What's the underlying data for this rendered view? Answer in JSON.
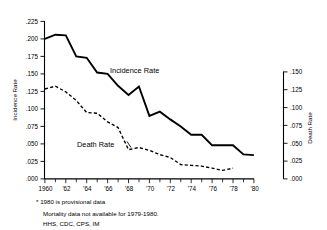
{
  "chart_data": {
    "type": "line",
    "title": "",
    "xlabel": "",
    "ylabel": "Incidence Rate",
    "y2label": "Death Rate",
    "grid": false,
    "legend_position": "inline-annotations",
    "x": [
      1960,
      1961,
      1962,
      1963,
      1964,
      1965,
      1966,
      1967,
      1968,
      1969,
      1970,
      1971,
      1972,
      1973,
      1974,
      1975,
      1976,
      1977,
      1978,
      1979,
      1980
    ],
    "xtick_labels": [
      "1960",
      "'62",
      "'64",
      "'66",
      "'68",
      "'70",
      "'72",
      "'74",
      "'76",
      "'78",
      "'80"
    ],
    "xtick_values": [
      1960,
      1962,
      1964,
      1966,
      1968,
      1970,
      1972,
      1974,
      1976,
      1978,
      1980
    ],
    "xlim": [
      1960,
      1980
    ],
    "ylim": [
      0.0,
      0.225
    ],
    "ytick_labels": [
      ".225",
      ".200",
      ".175",
      ".150",
      ".125",
      ".100",
      ".075",
      ".050",
      ".025",
      ".000"
    ],
    "ytick_values": [
      0.225,
      0.2,
      0.175,
      0.15,
      0.125,
      0.1,
      0.075,
      0.05,
      0.025,
      0.0
    ],
    "y2lim": [
      0.0,
      0.15
    ],
    "y2tick_labels": [
      ".150",
      ".125",
      ".100",
      ".075",
      ".050",
      ".025",
      ".000"
    ],
    "y2tick_values": [
      0.15,
      0.125,
      0.1,
      0.075,
      0.05,
      0.025,
      0.0
    ],
    "series": [
      {
        "name": "Incidence Rate",
        "axis": "left",
        "style": "solid",
        "color": "#000000",
        "x": [
          1960,
          1961,
          1962,
          1963,
          1964,
          1965,
          1966,
          1967,
          1968,
          1969,
          1970,
          1971,
          1972,
          1973,
          1974,
          1975,
          1976,
          1977,
          1978,
          1979,
          1980
        ],
        "values": [
          0.2,
          0.206,
          0.205,
          0.175,
          0.173,
          0.152,
          0.15,
          0.133,
          0.12,
          0.132,
          0.09,
          0.096,
          0.085,
          0.075,
          0.063,
          0.063,
          0.048,
          0.048,
          0.048,
          0.035,
          0.034
        ]
      },
      {
        "name": "Death Rate",
        "axis": "right",
        "style": "dashed",
        "color": "#000000",
        "x": [
          1960,
          1961,
          1962,
          1963,
          1964,
          1965,
          1966,
          1967,
          1968,
          1969,
          1970,
          1971,
          1972,
          1973,
          1974,
          1975,
          1976,
          1977,
          1978
        ],
        "values": [
          0.126,
          0.13,
          0.122,
          0.11,
          0.093,
          0.092,
          0.08,
          0.072,
          0.041,
          0.044,
          0.04,
          0.034,
          0.03,
          0.02,
          0.019,
          0.018,
          0.015,
          0.012,
          0.015
        ]
      }
    ],
    "annotations": [
      {
        "text": "Incidence Rate",
        "x": 1966,
        "y": 0.15
      },
      {
        "text": "Death Rate",
        "x": 1963.5,
        "y": 0.052
      }
    ]
  },
  "footnotes": {
    "line1": "* 1980 is provisional data",
    "line2": "Mortality data not available for 1979-1980.",
    "line3": "HHS, CDC, CPS, IM"
  }
}
